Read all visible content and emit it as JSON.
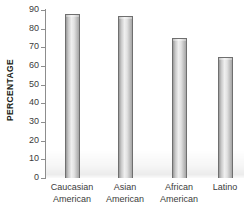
{
  "chart_data": {
    "type": "bar",
    "title": "",
    "xlabel": "",
    "ylabel": "PERCENTAGE",
    "categories": [
      "Caucasian American",
      "Asian American",
      "African American",
      "Latino"
    ],
    "category_lines": [
      [
        "Caucasian",
        "American"
      ],
      [
        "Asian",
        "American"
      ],
      [
        "African",
        "American"
      ],
      [
        "Latino",
        ""
      ]
    ],
    "values": [
      88,
      87,
      75,
      65
    ],
    "ylim": [
      0,
      90
    ],
    "yticks": [
      0,
      10,
      20,
      30,
      40,
      50,
      60,
      70,
      80,
      90
    ],
    "ytick_labels": [
      "0",
      "10",
      "20",
      "30",
      "40",
      "50",
      "60",
      "70",
      "80",
      "90"
    ],
    "grid": false,
    "legend": null,
    "legend_position": "none"
  },
  "axis": {
    "y_title": "PERCENTAGE",
    "tick_0": "0",
    "tick_10": "10",
    "tick_20": "20",
    "tick_30": "30",
    "tick_40": "40",
    "tick_50": "50",
    "tick_60": "60",
    "tick_70": "70",
    "tick_80": "80",
    "tick_90": "90"
  },
  "colors": {
    "bar_fill_light": "#efefef",
    "bar_fill_mid": "#c9c9c9",
    "bar_border": "#6f6f6f",
    "axis": "#8d8d8d",
    "text": "#3b3b3b",
    "title_text": "#231f20",
    "background": "#ffffff"
  }
}
